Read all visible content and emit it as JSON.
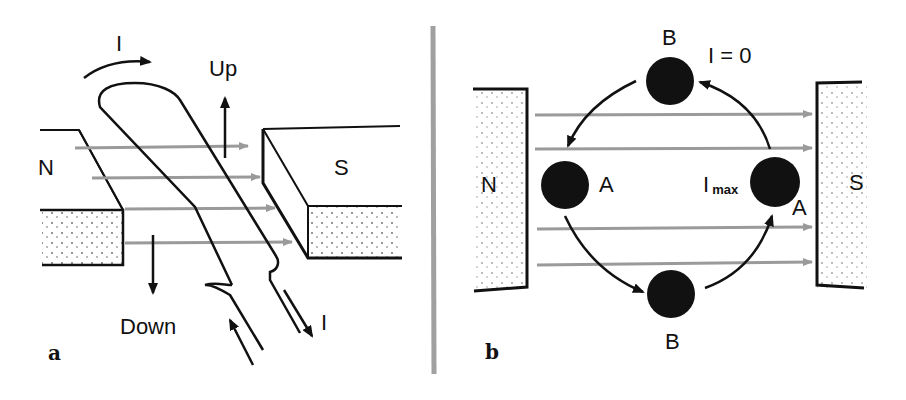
{
  "panel_a": {
    "letter": "a",
    "current_label_top": "I",
    "up_label": "Up",
    "down_label": "Down",
    "north_label": "N",
    "south_label": "S",
    "current_label_bottom": "I"
  },
  "panel_b": {
    "letter": "b",
    "top_label": "B",
    "zero_current_label": "I = 0",
    "north_label": "N",
    "south_label": "S",
    "left_label": "A",
    "imax_label_main": "I",
    "imax_label_sub": "max",
    "right_label": "A",
    "bottom_label": "B"
  },
  "colors": {
    "ink": "#111111",
    "field_lines": "#9a9a9a",
    "divider": "#a0a0a0"
  }
}
